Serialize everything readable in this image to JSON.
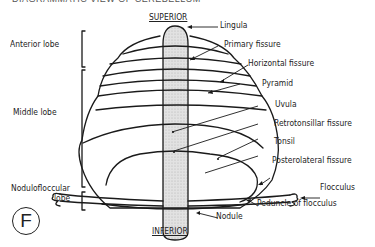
{
  "figure": {
    "header_text_clipped": "DIAGRAMMATIC VIEW OF CEREBELLUM",
    "panel_letter": "F",
    "orientation": {
      "top": "SUPERIOR",
      "bottom": "INFERIOR"
    },
    "lobes": [
      {
        "label": "Anterior lobe"
      },
      {
        "label": "Middle lobe"
      },
      {
        "label_line1": "Nodulofloccular",
        "label_line2": "lobe"
      }
    ],
    "structures": [
      {
        "label": "Lingula"
      },
      {
        "label": "Primary fissure"
      },
      {
        "label": "Horizontal fissure"
      },
      {
        "label": "Pyramid"
      },
      {
        "label": "Uvula"
      },
      {
        "label": "Retrotonsillar fissure"
      },
      {
        "label": "Tonsil"
      },
      {
        "label": "Posterolateral fissure"
      },
      {
        "label": "Flocculus"
      },
      {
        "label": "Peduncle of flocculus"
      },
      {
        "label": "Nodule"
      }
    ],
    "colors": {
      "line": "#1a1a1a",
      "vermis_fill": "#d9d9d9",
      "background": "#ffffff"
    }
  }
}
